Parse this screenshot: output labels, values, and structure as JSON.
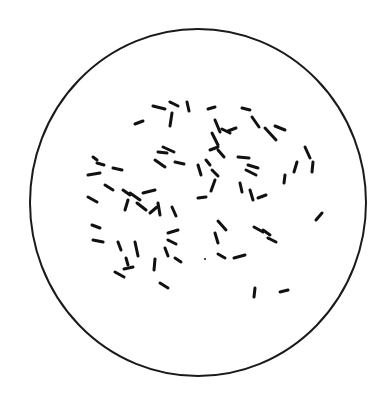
{
  "diagram": {
    "type": "microscope-field",
    "field": {
      "cx": 198,
      "cy": 202.5,
      "rx": 168,
      "ry": 173.5,
      "stroke": "#1a1a1a",
      "stroke_width": 2
    },
    "rod_color": "#111111",
    "rod_width": 3,
    "rods": [
      [
        153,
        106,
        165,
        109
      ],
      [
        170,
        102,
        178,
        106
      ],
      [
        187,
        102,
        189,
        111
      ],
      [
        172,
        113,
        170,
        126
      ],
      [
        135,
        124,
        143,
        121
      ],
      [
        208,
        109,
        215,
        107
      ],
      [
        215,
        120,
        220,
        132
      ],
      [
        222,
        129,
        230,
        133
      ],
      [
        228,
        131,
        236,
        128
      ],
      [
        242,
        108,
        250,
        110
      ],
      [
        252,
        117,
        259,
        127
      ],
      [
        275,
        126,
        285,
        130
      ],
      [
        265,
        128,
        276,
        140
      ],
      [
        210,
        150,
        218,
        147
      ],
      [
        212,
        133,
        218,
        145
      ],
      [
        218,
        150,
        224,
        157
      ],
      [
        238,
        157,
        249,
        158
      ],
      [
        248,
        165,
        258,
        168
      ],
      [
        246,
        170,
        256,
        175
      ],
      [
        305,
        147,
        310,
        158
      ],
      [
        297,
        162,
        294,
        172
      ],
      [
        313,
        162,
        312,
        172
      ],
      [
        285,
        175,
        284,
        183
      ],
      [
        240,
        183,
        242,
        192
      ],
      [
        250,
        190,
        253,
        200
      ],
      [
        258,
        198,
        266,
        195
      ],
      [
        198,
        198,
        206,
        197
      ],
      [
        215,
        180,
        211,
        191
      ],
      [
        212,
        170,
        218,
        176
      ],
      [
        198,
        165,
        201,
        175
      ],
      [
        206,
        160,
        210,
        165
      ],
      [
        158,
        152,
        167,
        153
      ],
      [
        155,
        160,
        165,
        167
      ],
      [
        175,
        162,
        184,
        164
      ],
      [
        163,
        147,
        174,
        152
      ],
      [
        93,
        157,
        97,
        160
      ],
      [
        97,
        163,
        104,
        165
      ],
      [
        113,
        168,
        122,
        170
      ],
      [
        88,
        175,
        100,
        173
      ],
      [
        105,
        185,
        113,
        190
      ],
      [
        123,
        190,
        130,
        195
      ],
      [
        130,
        193,
        140,
        200
      ],
      [
        143,
        193,
        155,
        190
      ],
      [
        88,
        197,
        97,
        202
      ],
      [
        128,
        200,
        125,
        210
      ],
      [
        137,
        203,
        146,
        210
      ],
      [
        150,
        213,
        157,
        207
      ],
      [
        158,
        203,
        160,
        215
      ],
      [
        172,
        207,
        176,
        216
      ],
      [
        92,
        225,
        100,
        228
      ],
      [
        93,
        240,
        103,
        242
      ],
      [
        118,
        242,
        121,
        250
      ],
      [
        135,
        242,
        138,
        256
      ],
      [
        126,
        258,
        128,
        265
      ],
      [
        133,
        267,
        124,
        269
      ],
      [
        115,
        272,
        124,
        277
      ],
      [
        155,
        259,
        154,
        270
      ],
      [
        160,
        283,
        168,
        288
      ],
      [
        168,
        233,
        178,
        230
      ],
      [
        168,
        240,
        176,
        244
      ],
      [
        165,
        248,
        168,
        256
      ],
      [
        175,
        258,
        181,
        262
      ],
      [
        218,
        221,
        226,
        230
      ],
      [
        215,
        233,
        218,
        243
      ],
      [
        218,
        254,
        225,
        258
      ],
      [
        234,
        258,
        245,
        255
      ],
      [
        254,
        227,
        263,
        232
      ],
      [
        263,
        230,
        270,
        235
      ],
      [
        268,
        238,
        276,
        242
      ],
      [
        316,
        220,
        322,
        213
      ],
      [
        255,
        288,
        254,
        297
      ],
      [
        280,
        292,
        288,
        290
      ]
    ],
    "dots": [
      [
        205,
        259
      ]
    ]
  }
}
